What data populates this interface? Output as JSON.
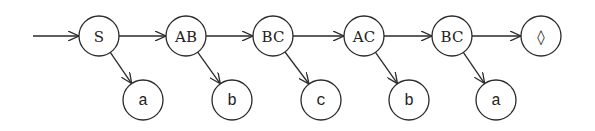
{
  "diagram": {
    "type": "linked-list-tree",
    "colors": {
      "stroke": "#2a2a2a",
      "text": "#222222",
      "background": "#ffffff"
    },
    "entry_arrow": {
      "from": [
        33,
        36
      ],
      "to": "n0"
    },
    "chain_nodes": [
      {
        "id": "n0",
        "label": "S",
        "cx": 99,
        "cy": 36,
        "r": 20
      },
      {
        "id": "n1",
        "label": "AB",
        "cx": 186,
        "cy": 36,
        "r": 20
      },
      {
        "id": "n2",
        "label": "BC",
        "cx": 273,
        "cy": 36,
        "r": 20
      },
      {
        "id": "n3",
        "label": "AC",
        "cx": 364,
        "cy": 36,
        "r": 20
      },
      {
        "id": "n4",
        "label": "BC",
        "cx": 452,
        "cy": 36,
        "r": 20
      },
      {
        "id": "n5",
        "label": "◊",
        "cx": 541,
        "cy": 36,
        "r": 20
      }
    ],
    "leaf_nodes": [
      {
        "id": "l0",
        "label": "a",
        "parent": "n0",
        "cx": 143,
        "cy": 100,
        "r": 20
      },
      {
        "id": "l1",
        "label": "b",
        "parent": "n1",
        "cx": 232,
        "cy": 100,
        "r": 20
      },
      {
        "id": "l2",
        "label": "c",
        "parent": "n2",
        "cx": 321,
        "cy": 100,
        "r": 20
      },
      {
        "id": "l3",
        "label": "b",
        "parent": "n3",
        "cx": 409,
        "cy": 100,
        "r": 20
      },
      {
        "id": "l4",
        "label": "a",
        "parent": "n4",
        "cx": 496,
        "cy": 100,
        "r": 20
      }
    ]
  }
}
